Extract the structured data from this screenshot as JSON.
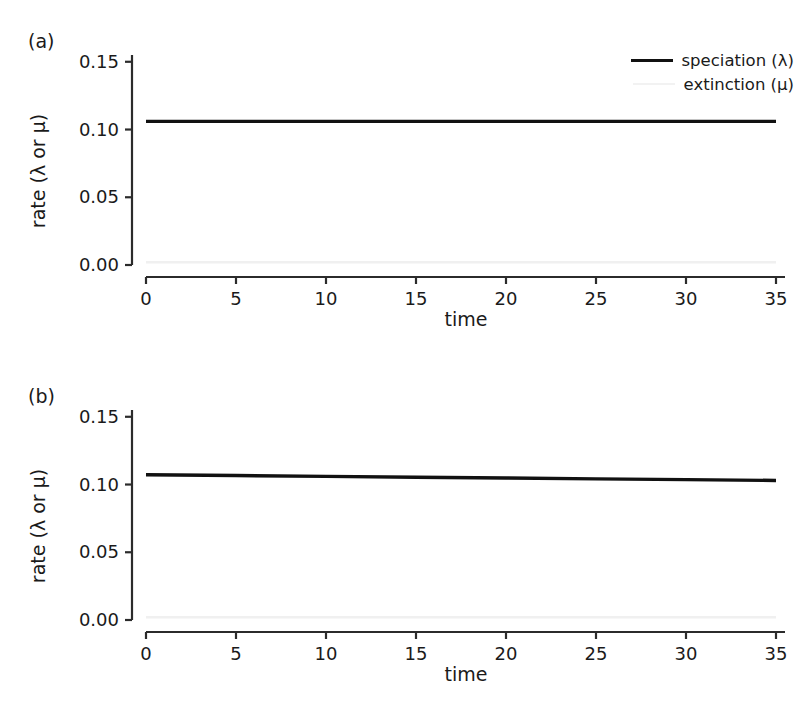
{
  "figure": {
    "background": "#ffffff",
    "panels": [
      {
        "id": "a",
        "label": "(a)",
        "legend": {
          "position": "top-right",
          "entries": [
            {
              "label": "speciation (λ)",
              "color": "#111111",
              "width": 3.4
            },
            {
              "label": "extinction (μ)",
              "color": "#f2f2f2",
              "width": 2.6
            }
          ]
        }
      },
      {
        "id": "b",
        "label": "(b)",
        "legend": {
          "position": "none",
          "entries": []
        }
      }
    ]
  },
  "chart_data": [
    {
      "type": "line",
      "panel": "a",
      "title": "(a)",
      "xlabel": "time",
      "ylabel": "rate (λ or μ)",
      "xlim": [
        0,
        35.5
      ],
      "ylim": [
        0.0,
        0.155
      ],
      "grid": false,
      "xticks": [
        0,
        5,
        10,
        15,
        20,
        25,
        30,
        35
      ],
      "xticklabels": [
        "0",
        "5",
        "10",
        "15",
        "20",
        "25",
        "30",
        "35"
      ],
      "yticks": [
        0.0,
        0.05,
        0.1,
        0.15
      ],
      "yticklabels": [
        "0.00",
        "0.05",
        "0.10",
        "0.15"
      ],
      "series": [
        {
          "name": "speciation (λ)",
          "color": "#111111",
          "linewidth": 3.4,
          "x": [
            0,
            5,
            10,
            15,
            20,
            25,
            30,
            35
          ],
          "values": [
            0.106,
            0.106,
            0.106,
            0.106,
            0.106,
            0.106,
            0.106,
            0.106
          ]
        },
        {
          "name": "extinction (μ)",
          "color": "#f0f0f0",
          "linewidth": 2.6,
          "x": [
            0,
            5,
            10,
            15,
            20,
            25,
            30,
            35
          ],
          "values": [
            0.002,
            0.002,
            0.002,
            0.002,
            0.002,
            0.002,
            0.002,
            0.002
          ]
        }
      ]
    },
    {
      "type": "line",
      "panel": "b",
      "title": "(b)",
      "xlabel": "time",
      "ylabel": "rate (λ or μ)",
      "xlim": [
        0,
        35.5
      ],
      "ylim": [
        0.0,
        0.155
      ],
      "grid": false,
      "xticks": [
        0,
        5,
        10,
        15,
        20,
        25,
        30,
        35
      ],
      "xticklabels": [
        "0",
        "5",
        "10",
        "15",
        "20",
        "25",
        "30",
        "35"
      ],
      "yticks": [
        0.0,
        0.05,
        0.1,
        0.15
      ],
      "yticklabels": [
        "0.00",
        "0.05",
        "0.10",
        "0.15"
      ],
      "series": [
        {
          "name": "speciation (λ)",
          "color": "#111111",
          "linewidth": 3.4,
          "x": [
            0,
            5,
            10,
            15,
            20,
            25,
            30,
            35
          ],
          "values": [
            0.1072,
            0.1066,
            0.106,
            0.1054,
            0.1048,
            0.1042,
            0.1036,
            0.103
          ]
        },
        {
          "name": "extinction (μ)",
          "color": "#f0f0f0",
          "linewidth": 2.6,
          "x": [
            0,
            5,
            10,
            15,
            20,
            25,
            30,
            35
          ],
          "values": [
            0.002,
            0.002,
            0.002,
            0.002,
            0.002,
            0.002,
            0.002,
            0.002
          ]
        }
      ]
    }
  ]
}
